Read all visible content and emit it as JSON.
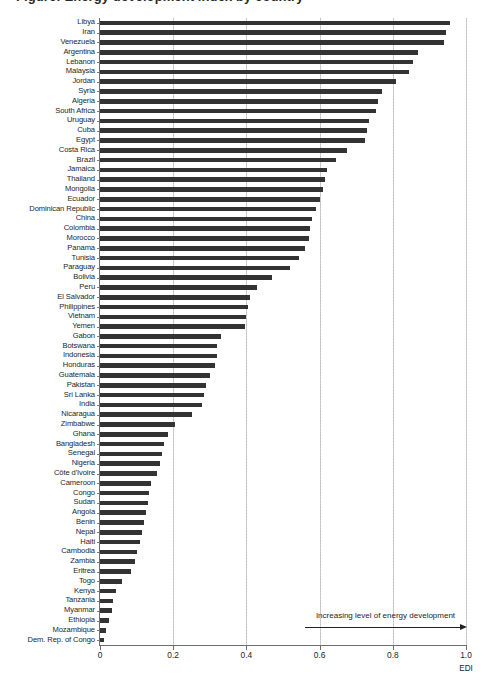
{
  "figure": {
    "title_fragment": "Figure: Energy development index by country",
    "annotation": "Increasing level of energy development",
    "arrow_icon": "arrow-right-icon"
  },
  "chart_data": {
    "type": "bar",
    "orientation": "horizontal",
    "title": "",
    "xlabel": "EDI",
    "ylabel": "",
    "xlim": [
      0,
      1.0
    ],
    "xticks": [
      "0",
      "0.2",
      "0.4",
      "0.6",
      "0.8",
      "1.0"
    ],
    "xtick_values": [
      0,
      0.2,
      0.4,
      0.6,
      0.8,
      1.0
    ],
    "grid": "vertical-dotted",
    "legend": "none",
    "bar_color": "#333333",
    "annotations": [
      "Increasing level of energy development"
    ],
    "categories": [
      "Libya",
      "Iran",
      "Venezuela",
      "Argentina",
      "Lebanon",
      "Malaysia",
      "Jordan",
      "Syria",
      "Algeria",
      "South Africa",
      "Uruguay",
      "Cuba",
      "Egypt",
      "Costa Rica",
      "Brazil",
      "Jamaica",
      "Thailand",
      "Mongolia",
      "Ecuador",
      "Dominican Republic",
      "China",
      "Colombia",
      "Morocco",
      "Panama",
      "Tunisia",
      "Paraguay",
      "Bolivia",
      "Peru",
      "El Salvador",
      "Philippines",
      "Vietnam",
      "Yemen",
      "Gabon",
      "Botswana",
      "Indonesia",
      "Honduras",
      "Guatemala",
      "Pakistan",
      "Sri Lanka",
      "India",
      "Nicaragua",
      "Zimbabwe",
      "Ghana",
      "Bangladesh",
      "Senegal",
      "Nigeria",
      "Côte d'Ivoire",
      "Cameroon",
      "Congo",
      "Sudan",
      "Angola",
      "Benin",
      "Nepal",
      "Haiti",
      "Cambodia",
      "Zambia",
      "Eritrea",
      "Togo",
      "Kenya",
      "Tanzania",
      "Myanmar",
      "Ethiopia",
      "Mozambique",
      "Dem. Rep. of Congo"
    ],
    "values": [
      0.955,
      0.945,
      0.94,
      0.87,
      0.855,
      0.845,
      0.81,
      0.77,
      0.76,
      0.755,
      0.735,
      0.73,
      0.725,
      0.675,
      0.645,
      0.62,
      0.615,
      0.61,
      0.6,
      0.59,
      0.58,
      0.575,
      0.57,
      0.56,
      0.545,
      0.52,
      0.47,
      0.43,
      0.41,
      0.405,
      0.4,
      0.395,
      0.33,
      0.32,
      0.32,
      0.315,
      0.3,
      0.29,
      0.285,
      0.28,
      0.25,
      0.205,
      0.185,
      0.175,
      0.17,
      0.165,
      0.155,
      0.14,
      0.135,
      0.13,
      0.125,
      0.12,
      0.115,
      0.11,
      0.1,
      0.095,
      0.085,
      0.06,
      0.045,
      0.035,
      0.032,
      0.025,
      0.017,
      0.012
    ]
  }
}
